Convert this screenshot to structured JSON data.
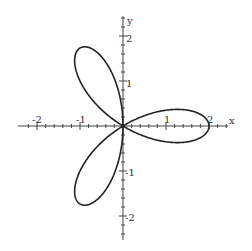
{
  "chart_data": {
    "type": "line",
    "title": "",
    "equation": "r = 2cos(3θ)",
    "curve": "six-petal rose",
    "xlabel": "x",
    "ylabel": "y",
    "xlim": [
      -2.3,
      2.4
    ],
    "ylim": [
      -2.5,
      2.4
    ],
    "x_ticks": [
      "-2",
      "-1",
      "1",
      "2"
    ],
    "y_ticks": [
      "2",
      "1",
      "-1",
      "-2"
    ],
    "petal_tips": [
      [
        2,
        0
      ],
      [
        1,
        1.732
      ],
      [
        -1,
        1.732
      ],
      [
        -2,
        0
      ],
      [
        -1,
        -1.732
      ],
      [
        1,
        -1.732
      ]
    ],
    "grid": false,
    "legend": "none"
  },
  "axes": {
    "x_label": "x",
    "y_label": "y",
    "x_tick_labels": {
      "neg2": "-2",
      "neg1": "-1",
      "pos1": "1",
      "pos2": "2"
    },
    "y_tick_labels": {
      "pos2": "2",
      "pos1": "1",
      "neg1": "-1",
      "neg2": "-2"
    }
  }
}
